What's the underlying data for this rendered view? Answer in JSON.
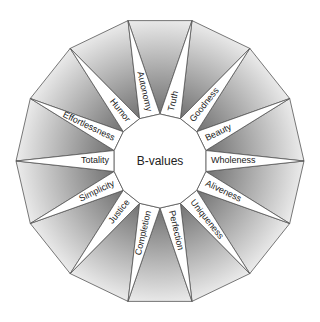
{
  "diagram": {
    "center_label": "B-values",
    "segments": [
      {
        "label": "Wholeness"
      },
      {
        "label": "Beauty"
      },
      {
        "label": "Goodness"
      },
      {
        "label": "Truth"
      },
      {
        "label": "Autonomy"
      },
      {
        "label": "Humor"
      },
      {
        "label": "Effortlessness"
      },
      {
        "label": "Totality"
      },
      {
        "label": "Simplicity"
      },
      {
        "label": "Justice"
      },
      {
        "label": "Completion"
      },
      {
        "label": "Perfection"
      },
      {
        "label": "Uniqueness"
      },
      {
        "label": "Aliveness"
      }
    ],
    "colors": {
      "outline": "#555555",
      "gray_dark": "#7a7a7a",
      "gray_light": "#f2f2f2",
      "spike": "#ffffff"
    }
  }
}
